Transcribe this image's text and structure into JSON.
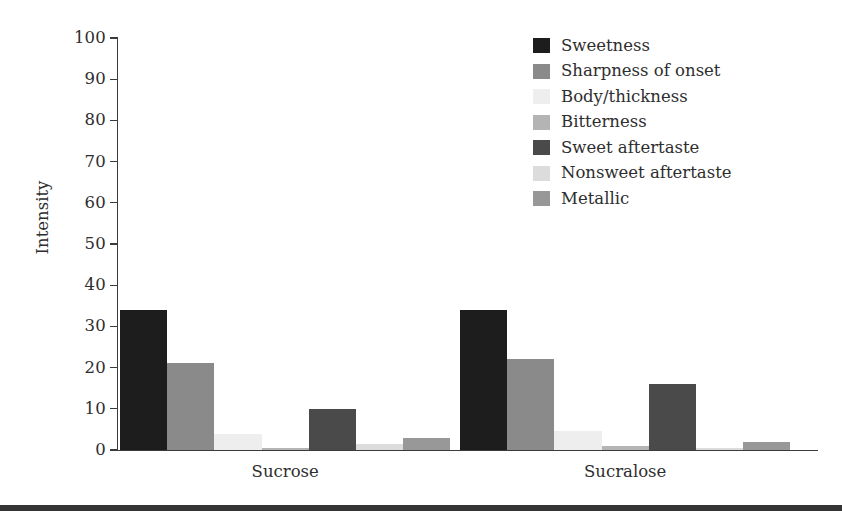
{
  "chart_data": {
    "type": "bar",
    "title": "",
    "subtitle": "",
    "xlabel": "",
    "ylabel": "Intensity",
    "ylim": [
      0,
      100
    ],
    "yticks": [
      0,
      10,
      20,
      30,
      40,
      50,
      60,
      70,
      80,
      90,
      100
    ],
    "ytick_labels": [
      "0",
      "10",
      "20",
      "30",
      "40",
      "50",
      "60",
      "70",
      "80",
      "90",
      "100"
    ],
    "grid": false,
    "legend_position": "top-right",
    "categories": [
      "Sucrose",
      "Sucralose"
    ],
    "series": [
      {
        "name": "Sweetness",
        "color": "#1d1d1d",
        "values": [
          34,
          34
        ]
      },
      {
        "name": "Sharpness of onset",
        "color": "#8a8a8a",
        "values": [
          21,
          22
        ]
      },
      {
        "name": "Body/thickness",
        "color": "#eeeeee",
        "values": [
          4,
          4.5
        ]
      },
      {
        "name": "Bitterness",
        "color": "#b4b4b4",
        "values": [
          0.5,
          1
        ]
      },
      {
        "name": "Sweet aftertaste",
        "color": "#4a4a4a",
        "values": [
          10,
          16
        ]
      },
      {
        "name": "Nonsweet aftertaste",
        "color": "#dcdcdc",
        "values": [
          1.5,
          0.5
        ]
      },
      {
        "name": "Metallic",
        "color": "#989898",
        "values": [
          3,
          2
        ]
      }
    ]
  },
  "legend": {
    "items": [
      {
        "label": "Sweetness"
      },
      {
        "label": "Sharpness of onset"
      },
      {
        "label": "Body/thickness"
      },
      {
        "label": "Bitterness"
      },
      {
        "label": "Sweet aftertaste"
      },
      {
        "label": "Nonsweet aftertaste"
      },
      {
        "label": "Metallic"
      }
    ]
  },
  "axes": {
    "y_title": "Intensity",
    "x_group_labels": [
      "Sucrose",
      "Sucralose"
    ]
  },
  "style": {
    "axis_color": "#3b3b3b",
    "text_color": "#2e2e2e",
    "rule_color": "#353535",
    "background": "#ffffff"
  }
}
